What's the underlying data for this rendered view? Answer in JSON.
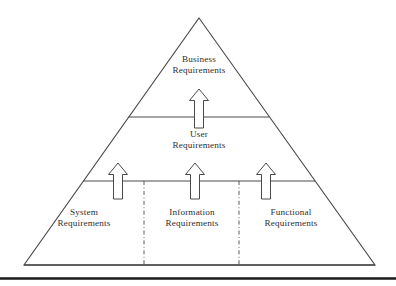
{
  "diagram": {
    "type": "pyramid-hierarchy",
    "background_color": "#ffffff",
    "line_color": "#4a4a4a",
    "text_color": "#2e2e30",
    "levels": [
      {
        "id": "business",
        "tier": 1,
        "line1": "Business",
        "line2": "Requirements"
      },
      {
        "id": "user",
        "tier": 2,
        "line1": "User",
        "line2": "Requirements"
      },
      {
        "id": "system",
        "tier": 3,
        "segment": "left",
        "line1": "System",
        "line2": "Requirements"
      },
      {
        "id": "information",
        "tier": 3,
        "segment": "center",
        "line1": "Information",
        "line2": "Requirements"
      },
      {
        "id": "functional",
        "tier": 3,
        "segment": "right",
        "line1": "Functional",
        "line2": "Requirements"
      }
    ],
    "arrows": {
      "direction": "up",
      "style": "hollow-block-arrow",
      "count": 4
    },
    "dividers": {
      "horizontal_count": 2,
      "vertical_dashdot_count": 2
    },
    "footer_rule": true
  }
}
